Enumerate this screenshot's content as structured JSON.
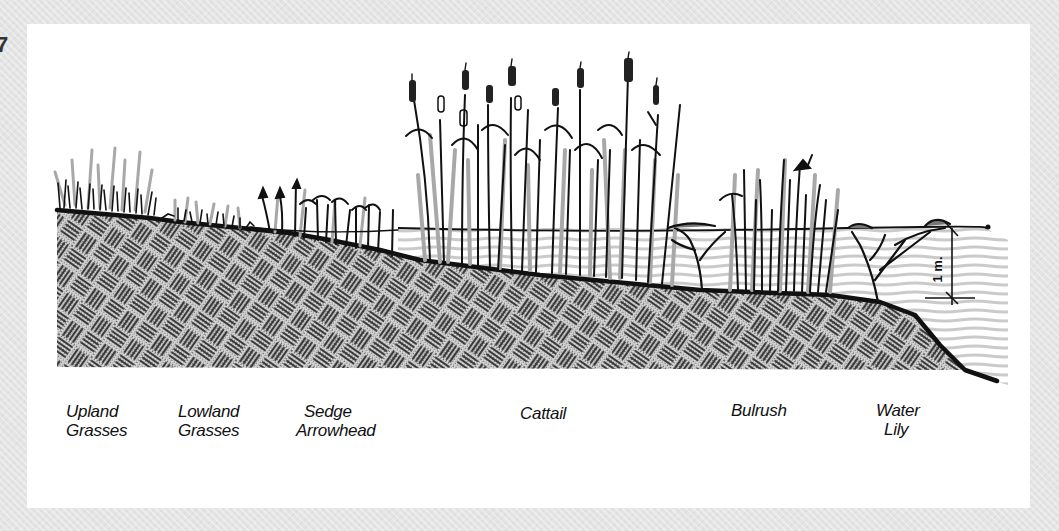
{
  "page": {
    "edge_glyph": "7",
    "background_color": "#e4e4e4",
    "panel_color": "#ffffff"
  },
  "diagram": {
    "type": "wetland-plant-zonation-cross-section",
    "depth_marker": "1 m.",
    "zones": [
      {
        "id": "upland",
        "line1": "Upland",
        "line2": "Grasses"
      },
      {
        "id": "lowland",
        "line1": "Lowland",
        "line2": "Grasses"
      },
      {
        "id": "sedge",
        "line1": "Sedge",
        "line2": "Arrowhead"
      },
      {
        "id": "cattail",
        "line1": "Cattail",
        "line2": ""
      },
      {
        "id": "bulrush",
        "line1": "Bulrush",
        "line2": ""
      },
      {
        "id": "waterlily",
        "line1": "Water",
        "line2": "Lily"
      }
    ],
    "colors": {
      "ink": "#111111",
      "soil_fill": "#b9b9b9",
      "soil_hatch": "#3a3a3a",
      "water_lines": "#c8c8c8",
      "plant_shadow": "#a8a8a8"
    }
  }
}
